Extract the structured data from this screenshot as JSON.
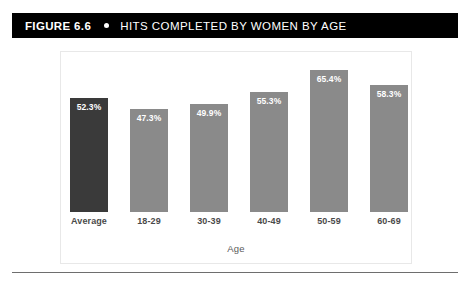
{
  "figure": {
    "label": "FIGURE 6.6",
    "separator_icon": "bullet-dot-icon",
    "title": "HITS COMPLETED BY WOMEN BY AGE"
  },
  "colors": {
    "title_bar_background": "#000000",
    "title_text": "#ffffff",
    "bar_default": "#8a8a8a",
    "bar_highlight": "#3a3a3a",
    "panel_border": "#e8e8e8",
    "rule": "#6e6e6e"
  },
  "chart_data": {
    "type": "bar",
    "title": "HITS COMPLETED BY WOMEN BY AGE",
    "xlabel": "Age",
    "ylabel": "",
    "ylim": [
      0,
      70
    ],
    "grid": false,
    "legend": "none",
    "categories": [
      "Average",
      "18-29",
      "30-39",
      "40-49",
      "50-59",
      "60-69"
    ],
    "values": [
      52.3,
      47.3,
      49.9,
      55.3,
      65.4,
      58.3
    ],
    "value_labels": [
      "52.3%",
      "47.3%",
      "49.9%",
      "55.3%",
      "65.4%",
      "58.3%"
    ],
    "bar_colors": [
      "#3a3a3a",
      "#8a8a8a",
      "#8a8a8a",
      "#8a8a8a",
      "#8a8a8a",
      "#8a8a8a"
    ],
    "highlight_index": 0
  }
}
